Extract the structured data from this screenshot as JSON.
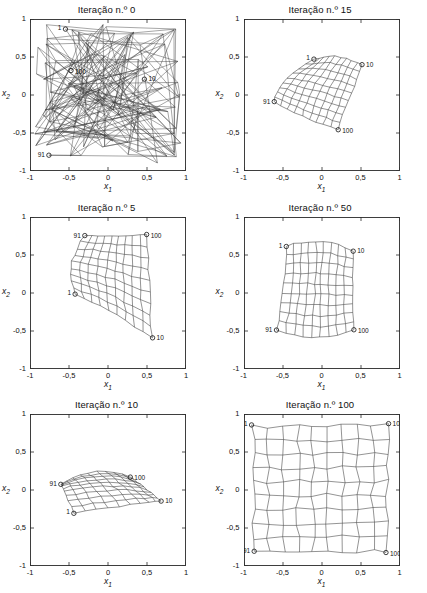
{
  "figure": {
    "panel_count": 6,
    "axes": {
      "xlabel": "x",
      "xlabel_sub": "1",
      "ylabel": "x",
      "ylabel_sub": "2",
      "xticks": [
        "-1",
        "-0,5",
        "0",
        "0,5",
        "1"
      ],
      "yticks": [
        "1",
        "0,5",
        "0",
        "-0,5",
        "-1"
      ],
      "xlim": [
        -1,
        1
      ],
      "ylim": [
        -1,
        1
      ],
      "grid": false
    },
    "marker_labels": [
      "1",
      "10",
      "91",
      "100"
    ]
  },
  "panels": [
    {
      "title": "Iteração n.º 0",
      "iteration": 0
    },
    {
      "title": "Iteração n.º 15",
      "iteration": 15
    },
    {
      "title": "Iteração n.º 5",
      "iteration": 5
    },
    {
      "title": "Iteração n.º 50",
      "iteration": 50
    },
    {
      "title": "Iteração n.º 10",
      "iteration": 10
    },
    {
      "title": "Iteração n.º 100",
      "iteration": 100
    }
  ],
  "chart_data": {
    "type": "scatter",
    "xlabel": "x1",
    "ylabel": "x2",
    "xlim": [
      -1,
      1
    ],
    "ylim": [
      -1,
      1
    ],
    "xticks": [
      -1,
      -0.5,
      0,
      0.5,
      1
    ],
    "yticks": [
      -1,
      -0.5,
      0,
      0.5,
      1
    ],
    "grid": false,
    "legend": "none",
    "lattice_rows": 10,
    "lattice_cols": 10,
    "corner_neuron_indices": {
      "top_left": 1,
      "top_right": 10,
      "bottom_left": 91,
      "bottom_right": 100
    },
    "series": [
      {
        "name": "Iteração n.º 0",
        "iteration": 0,
        "description": "Random initial weights; lattice connections cross the whole square chaotically.",
        "mode": "random",
        "seed": 20250104,
        "spread": [
          -0.95,
          0.95
        ],
        "corners": {
          "1": [
            -0.88,
            0.7
          ],
          "10": [
            0.42,
            0.52
          ],
          "91": [
            -0.62,
            -0.42
          ],
          "100": [
            0.58,
            0.02
          ]
        }
      },
      {
        "name": "Iteração n.º 5",
        "iteration": 5,
        "description": "Lattice untangled into a leaning quadrilateral sheet in the upper/right region.",
        "mode": "ordered",
        "seed": 501,
        "jitter": 0.012,
        "corners": {
          "1": [
            -0.42,
            -0.02
          ],
          "10": [
            0.56,
            -0.6
          ],
          "91": [
            -0.3,
            0.76
          ],
          "100": [
            0.5,
            0.76
          ]
        }
      },
      {
        "name": "Iteração n.º 10",
        "iteration": 10,
        "description": "Sheet folded into a fan/wedge converging toward the right-hand corner.",
        "mode": "ordered",
        "seed": 1002,
        "jitter": 0.01,
        "corners": {
          "1": [
            -0.44,
            -0.3
          ],
          "10": [
            0.68,
            -0.14
          ],
          "91": [
            -0.6,
            0.07
          ],
          "100": [
            -0.2,
            0.57
          ]
        }
      },
      {
        "name": "Iteração n.º 15",
        "iteration": 15,
        "description": "Curved concave sheet spanning the central area.",
        "mode": "ordered",
        "seed": 1503,
        "jitter": 0.01,
        "corners": {
          "1": [
            -0.11,
            0.47
          ],
          "10": [
            0.52,
            0.4
          ],
          "91": [
            -0.62,
            -0.08
          ],
          "100": [
            0.2,
            -0.45
          ]
        }
      },
      {
        "name": "Iteração n.º 50",
        "iteration": 50,
        "description": "Near-square lattice with slightly concave top and bottom edges.",
        "mode": "ordered",
        "seed": 5004,
        "jitter": 0.012,
        "corners": {
          "1": [
            -0.45,
            0.62
          ],
          "10": [
            0.4,
            0.56
          ],
          "91": [
            -0.58,
            -0.49
          ],
          "100": [
            0.41,
            -0.49
          ]
        }
      },
      {
        "name": "Iteração n.º 100",
        "iteration": 100,
        "description": "Lattice converged to fill the input square almost uniformly.",
        "mode": "ordered",
        "seed": 10005,
        "jitter": 0.03,
        "corners": {
          "1": [
            -0.88,
            0.84
          ],
          "10": [
            0.84,
            0.85
          ],
          "91": [
            -0.88,
            -0.81
          ],
          "100": [
            0.84,
            -0.8
          ]
        }
      }
    ]
  }
}
